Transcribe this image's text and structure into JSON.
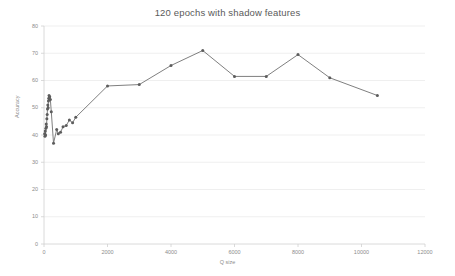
{
  "chart_data": {
    "type": "line",
    "title": "120 epochs with shadow features",
    "xlabel": "Q size",
    "ylabel": "Accuracy",
    "xlim": [
      0,
      12000
    ],
    "ylim": [
      0,
      80
    ],
    "xticks": [
      0,
      2000,
      4000,
      6000,
      8000,
      10000,
      12000
    ],
    "xtick_labels": [
      "0",
      "2000",
      "4000",
      "6000",
      "8000",
      "10000",
      "12000"
    ],
    "yticks": [
      0,
      10,
      20,
      30,
      40,
      50,
      60,
      70,
      80
    ],
    "ytick_labels": [
      "0",
      "10",
      "20",
      "30",
      "40",
      "50",
      "60",
      "70",
      "80"
    ],
    "grid": true,
    "grid_axis": "y",
    "legend": "none",
    "series": [
      {
        "name": "Accuracy vs Q size",
        "marker": "circle",
        "color": "#707070",
        "points": [
          [
            20,
            40.5
          ],
          [
            30,
            39.5
          ],
          [
            40,
            41.5
          ],
          [
            50,
            40.0
          ],
          [
            60,
            42.5
          ],
          [
            70,
            44.0
          ],
          [
            80,
            43.0
          ],
          [
            90,
            46.0
          ],
          [
            100,
            47.5
          ],
          [
            110,
            49.5
          ],
          [
            120,
            51.0
          ],
          [
            130,
            50.0
          ],
          [
            140,
            52.5
          ],
          [
            150,
            53.5
          ],
          [
            160,
            54.5
          ],
          [
            170,
            53.0
          ],
          [
            180,
            54.0
          ],
          [
            200,
            53.0
          ],
          [
            230,
            48.5
          ],
          [
            300,
            37.0
          ],
          [
            400,
            42.0
          ],
          [
            450,
            40.5
          ],
          [
            520,
            41.0
          ],
          [
            600,
            43.0
          ],
          [
            700,
            43.5
          ],
          [
            800,
            45.5
          ],
          [
            900,
            44.5
          ],
          [
            1000,
            46.5
          ],
          [
            2000,
            58.0
          ],
          [
            3000,
            58.5
          ],
          [
            4000,
            65.5
          ],
          [
            5000,
            71.0
          ],
          [
            6000,
            61.5
          ],
          [
            7000,
            61.5
          ],
          [
            8000,
            69.5
          ],
          [
            9000,
            61.0
          ],
          [
            10500,
            54.5
          ]
        ]
      }
    ]
  },
  "axes": {
    "tick_color": "#8c8c8c",
    "grid_color": "#e8e8e8",
    "axis_color": "#d0d0d0",
    "line_color": "#707070",
    "marker_color": "#5c5c5c",
    "title_color": "#5a5a5a"
  }
}
